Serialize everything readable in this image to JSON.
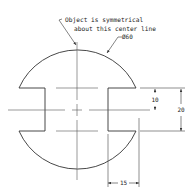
{
  "drawing": {
    "note_line1": "Object is symmetrical",
    "note_line2": "about this center line",
    "diameter_label": "Ø60",
    "dim_10": "10",
    "dim_20": "20",
    "dim_15": "15",
    "line_color": "#333333",
    "center_line_color": "#555555"
  }
}
